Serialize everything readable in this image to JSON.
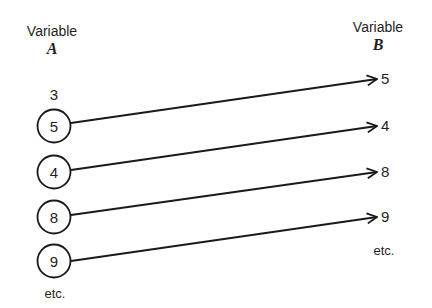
{
  "left": {
    "header": "Variable",
    "name": "A",
    "extra_value": "3",
    "values": [
      "5",
      "4",
      "8",
      "9"
    ],
    "etc": "etc."
  },
  "right": {
    "header": "Variable",
    "name": "B",
    "values": [
      "5",
      "4",
      "8",
      "9"
    ],
    "etc": "etc."
  },
  "mapping": [
    {
      "from": "5",
      "to": "5"
    },
    {
      "from": "4",
      "to": "4"
    },
    {
      "from": "8",
      "to": "8"
    },
    {
      "from": "9",
      "to": "9"
    }
  ]
}
